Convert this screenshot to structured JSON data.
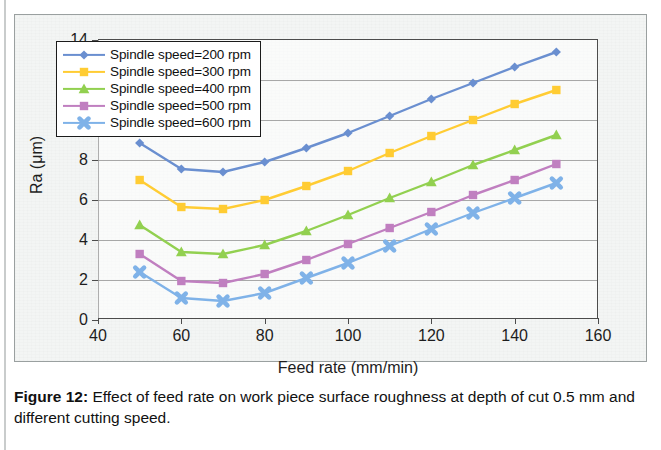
{
  "figure": {
    "caption_label": "Figure 12:",
    "caption_text": " Effect of feed rate on work piece surface roughness at depth of cut 0.5 mm and different cutting speed."
  },
  "colors": {
    "series_200": "#6a8fd0",
    "series_300": "#ffcc33",
    "series_400": "#92d050",
    "series_500": "#c07fc0",
    "series_600": "#7fb2e8",
    "gridline": "#8c8c8c",
    "axis": "#4c4c4c",
    "legend_border": "#1b1b1b",
    "figure_background": "#f3f5f4"
  },
  "chart_data": {
    "type": "line",
    "title": "",
    "xlabel": "Feed rate (mm/min)",
    "ylabel": "Ra (μm)",
    "xlim": [
      40,
      160
    ],
    "ylim": [
      0,
      14
    ],
    "xticks": [
      40,
      60,
      80,
      100,
      120,
      140,
      160
    ],
    "yticks": [
      0,
      2,
      4,
      6,
      8,
      10,
      12,
      14
    ],
    "grid": "horizontal",
    "legend_position": "upper-left-inside",
    "x": [
      50,
      60,
      70,
      80,
      90,
      100,
      110,
      120,
      130,
      140,
      150
    ],
    "series": [
      {
        "name": "Spindle speed=200 rpm",
        "color": "#6a8fd0",
        "marker": "diamond",
        "values": [
          8.85,
          7.55,
          7.4,
          7.9,
          8.6,
          9.35,
          10.2,
          11.05,
          11.85,
          12.65,
          13.4
        ]
      },
      {
        "name": "Spindle speed=300 rpm",
        "color": "#ffcc33",
        "marker": "square",
        "values": [
          7.0,
          5.65,
          5.55,
          6.0,
          6.7,
          7.45,
          8.35,
          9.2,
          10.0,
          10.8,
          11.5
        ]
      },
      {
        "name": "Spindle speed=400 rpm",
        "color": "#92d050",
        "marker": "triangle",
        "values": [
          4.75,
          3.4,
          3.3,
          3.75,
          4.45,
          5.25,
          6.1,
          6.9,
          7.75,
          8.5,
          9.25
        ]
      },
      {
        "name": "Spindle speed=500 rpm",
        "color": "#c07fc0",
        "marker": "square",
        "values": [
          3.3,
          1.95,
          1.85,
          2.3,
          3.0,
          3.8,
          4.6,
          5.4,
          6.25,
          7.0,
          7.8
        ]
      },
      {
        "name": "Spindle speed=600 rpm",
        "color": "#7fb2e8",
        "marker": "cross",
        "values": [
          2.4,
          1.1,
          0.95,
          1.35,
          2.1,
          2.85,
          3.7,
          4.55,
          5.35,
          6.1,
          6.85
        ]
      }
    ]
  }
}
